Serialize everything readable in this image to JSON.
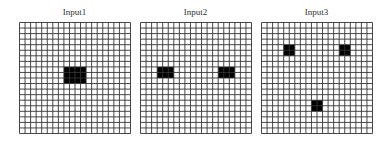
{
  "figure": {
    "grid_size": 20,
    "panels": [
      {
        "title": "Input1",
        "blocks": [
          {
            "col": 8,
            "row": 8,
            "w": 4,
            "h": 3
          }
        ]
      },
      {
        "title": "Input2",
        "blocks": [
          {
            "col": 3,
            "row": 8,
            "w": 3,
            "h": 2
          },
          {
            "col": 14,
            "row": 8,
            "w": 3,
            "h": 2
          }
        ]
      },
      {
        "title": "Input3",
        "blocks": [
          {
            "col": 4,
            "row": 4,
            "w": 2,
            "h": 2
          },
          {
            "col": 14,
            "row": 4,
            "w": 2,
            "h": 2
          },
          {
            "col": 9,
            "row": 14,
            "w": 2,
            "h": 2
          }
        ]
      }
    ],
    "colors": {
      "grid_line": "#333333",
      "block": "#000000",
      "background": "#ffffff"
    }
  }
}
